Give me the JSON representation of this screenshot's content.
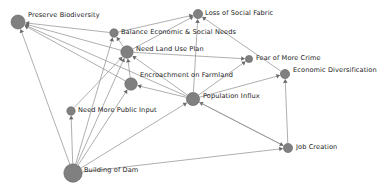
{
  "diagram": {
    "type": "directed-influence-graph",
    "title": "",
    "background_color": "#ffffff",
    "node_color": "#808080",
    "edge_color": "#8d8d8d",
    "arrow_color": "#6a6a6a",
    "label_color": "#1a1a1a",
    "nodes": [
      {
        "id": "preserve_biodiversity",
        "label": "Preserve Biodiversity",
        "x": 18,
        "y": 22,
        "r": 7.0,
        "label_x": 28,
        "label_y": 11
      },
      {
        "id": "balance_economic_social",
        "label": "Balance Economic & Social Needs",
        "x": 114,
        "y": 33,
        "r": 4.2,
        "label_x": 121,
        "label_y": 28
      },
      {
        "id": "loss_social_fabric",
        "label": "Loss of Social Fabric",
        "x": 198,
        "y": 14,
        "r": 4.6,
        "label_x": 205,
        "label_y": 9
      },
      {
        "id": "need_land_use_plan",
        "label": "Need Land Use Plan",
        "x": 127,
        "y": 52,
        "r": 6.2,
        "label_x": 136,
        "label_y": 45
      },
      {
        "id": "fear_more_crime",
        "label": "Fear of More Crime",
        "x": 249,
        "y": 59,
        "r": 3.6,
        "label_x": 256,
        "label_y": 54
      },
      {
        "id": "encroachment_farmland",
        "label": "Encroachment on Farmland",
        "x": 131,
        "y": 84,
        "r": 6.2,
        "label_x": 140,
        "label_y": 71
      },
      {
        "id": "economic_diversification",
        "label": "Economic Diversification",
        "x": 285,
        "y": 74,
        "r": 4.6,
        "label_x": 293,
        "label_y": 66
      },
      {
        "id": "population_influx",
        "label": "Population Influx",
        "x": 193,
        "y": 99,
        "r": 6.6,
        "label_x": 203,
        "label_y": 92
      },
      {
        "id": "need_public_input",
        "label": "Need More Public Input",
        "x": 71,
        "y": 111,
        "r": 4.2,
        "label_x": 78,
        "label_y": 106
      },
      {
        "id": "job_creation",
        "label": "Job Creation",
        "x": 288,
        "y": 148,
        "r": 4.6,
        "label_x": 296,
        "label_y": 143
      },
      {
        "id": "building_of_dam",
        "label": "Building of Dam",
        "x": 73,
        "y": 173,
        "r": 9.2,
        "label_x": 84,
        "label_y": 166
      }
    ],
    "edges": [
      {
        "from": "balance_economic_social",
        "to": "preserve_biodiversity"
      },
      {
        "from": "need_land_use_plan",
        "to": "preserve_biodiversity"
      },
      {
        "from": "encroachment_farmland",
        "to": "preserve_biodiversity"
      },
      {
        "from": "population_influx",
        "to": "preserve_biodiversity"
      },
      {
        "from": "building_of_dam",
        "to": "preserve_biodiversity"
      },
      {
        "from": "need_land_use_plan",
        "to": "balance_economic_social"
      },
      {
        "from": "building_of_dam",
        "to": "balance_economic_social"
      },
      {
        "from": "balance_economic_social",
        "to": "loss_social_fabric"
      },
      {
        "from": "need_land_use_plan",
        "to": "loss_social_fabric"
      },
      {
        "from": "population_influx",
        "to": "loss_social_fabric"
      },
      {
        "from": "economic_diversification",
        "to": "loss_social_fabric"
      },
      {
        "from": "encroachment_farmland",
        "to": "need_land_use_plan"
      },
      {
        "from": "population_influx",
        "to": "need_land_use_plan"
      },
      {
        "from": "need_public_input",
        "to": "need_land_use_plan"
      },
      {
        "from": "building_of_dam",
        "to": "need_land_use_plan"
      },
      {
        "from": "need_land_use_plan",
        "to": "fear_more_crime"
      },
      {
        "from": "population_influx",
        "to": "fear_more_crime"
      },
      {
        "from": "population_influx",
        "to": "encroachment_farmland"
      },
      {
        "from": "building_of_dam",
        "to": "encroachment_farmland"
      },
      {
        "from": "population_influx",
        "to": "economic_diversification"
      },
      {
        "from": "job_creation",
        "to": "economic_diversification"
      },
      {
        "from": "job_creation",
        "to": "population_influx"
      },
      {
        "from": "building_of_dam",
        "to": "population_influx"
      },
      {
        "from": "building_of_dam",
        "to": "need_public_input"
      },
      {
        "from": "building_of_dam",
        "to": "job_creation"
      },
      {
        "from": "population_influx",
        "to": "job_creation"
      }
    ]
  }
}
